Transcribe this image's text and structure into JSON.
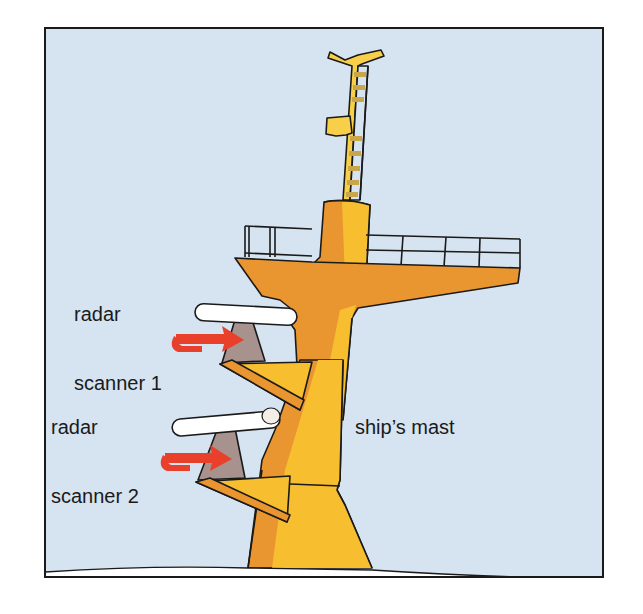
{
  "figure": {
    "type": "labeled illustration",
    "labels": {
      "scanner1_line1": "radar",
      "scanner1_line2": "scanner 1",
      "scanner2_line1": "radar",
      "scanner2_line2": "scanner 2",
      "mast": "ship’s mast"
    },
    "elements": [
      {
        "name": "ship's mast",
        "color": "#f5b324"
      },
      {
        "name": "radar scanner 1",
        "color": "#ffffff",
        "rotation_arrow_color": "#e8402a"
      },
      {
        "name": "radar scanner 2",
        "color": "#ffffff",
        "rotation_arrow_color": "#e8402a"
      },
      {
        "name": "railing platform",
        "color": "#e9962e"
      },
      {
        "name": "top ladder mast",
        "color": "#f7cf48"
      }
    ],
    "colors": {
      "sky": "#d6e3f0",
      "mast_light": "#f7be30",
      "mast_dark": "#ea9630",
      "scanner_mount": "#a7928e",
      "arrow": "#e8402a",
      "outline": "#1a1a1a",
      "deck": "#ffffff"
    }
  }
}
